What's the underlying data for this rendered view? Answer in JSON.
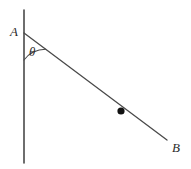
{
  "canvas": {
    "width": 191,
    "height": 169,
    "background_color": "#ffffff"
  },
  "figure": {
    "stroke_color": "#4a4a4a",
    "dot_color": "#111111"
  },
  "labels": {
    "vertex_a": "A",
    "vertex_b": "B",
    "angle": "θ"
  },
  "geometry": {
    "vertical_line": {
      "name": "vertical-line",
      "x1": 24,
      "y1": 10,
      "x2": 24,
      "y2": 163,
      "stroke_width": 1.6
    },
    "segment_ab": {
      "name": "segment-a-to-b",
      "x1": 24,
      "y1": 33,
      "x2": 167,
      "y2": 140,
      "stroke_width": 1.3
    },
    "angle_arc": {
      "name": "angle-arc-theta",
      "center_x": 24,
      "center_y": 33,
      "radius": 27,
      "start_x": 24,
      "start_y": 60,
      "end_x": 45.6,
      "end_y": 49.2,
      "stroke_width": 1.1
    },
    "point_on_segment": {
      "name": "point-marker",
      "cx": 121,
      "cy": 111,
      "r": 3.6
    }
  },
  "label_positions": {
    "vertex_a": {
      "x": 10,
      "y": 36
    },
    "vertex_b": {
      "x": 172,
      "y": 152
    },
    "angle": {
      "x": 29,
      "y": 56
    }
  }
}
